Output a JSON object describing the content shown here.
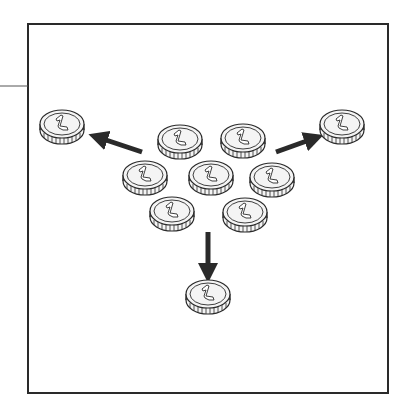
{
  "diagram": {
    "title": "",
    "colors": {
      "stroke": "#2a2a2a",
      "coin_fill": "#f4f4f4",
      "arrow": "#2a2a2a",
      "frame": "#2a2a2a"
    },
    "coin_label": "1",
    "coins": [
      {
        "id": "cluster-top-left",
        "cx": 180,
        "cy": 142
      },
      {
        "id": "cluster-top-right",
        "cx": 243,
        "cy": 141
      },
      {
        "id": "cluster-mid-left",
        "cx": 145,
        "cy": 178
      },
      {
        "id": "cluster-mid-center",
        "cx": 211,
        "cy": 178
      },
      {
        "id": "cluster-mid-right",
        "cx": 272,
        "cy": 180
      },
      {
        "id": "cluster-bottom-left",
        "cx": 172,
        "cy": 214
      },
      {
        "id": "cluster-bottom-right",
        "cx": 245,
        "cy": 215
      },
      {
        "id": "outer-left",
        "cx": 62,
        "cy": 127
      },
      {
        "id": "outer-right",
        "cx": 342,
        "cy": 127
      },
      {
        "id": "outer-bottom",
        "cx": 208,
        "cy": 297
      }
    ],
    "arrows": [
      {
        "id": "arrow-left",
        "x1": 142,
        "y1": 152,
        "x2": 97,
        "y2": 137
      },
      {
        "id": "arrow-right",
        "x1": 276,
        "y1": 152,
        "x2": 315,
        "y2": 138
      },
      {
        "id": "arrow-down",
        "x1": 208,
        "y1": 232,
        "x2": 208,
        "y2": 274
      }
    ]
  }
}
